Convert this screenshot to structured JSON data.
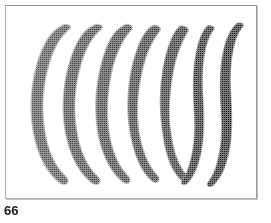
{
  "figure": {
    "caption_number": "66",
    "background_color": "#ffffff",
    "frame_color": "#8c8c8c",
    "caption_color": "#1b1b1b",
    "page_width": 271,
    "page_height": 223,
    "plate": {
      "x": 5,
      "y": 5,
      "width": 252,
      "height": 194
    },
    "specimen_count": 7,
    "specimens": [
      {
        "index": 1,
        "label": "specimen-1",
        "shape": "broad-crescent",
        "fill": "#4a4a4a",
        "edge": "#8e8e8e",
        "max_width_px": 26,
        "height_px": 150,
        "center_x": 52,
        "curvature": "strong-left-bow",
        "path": "M 62 27 C 52 31 44 44 38 64 C 31 88 30 116 36 140 C 41 160 50 174 60 182 C 63 184 66 184 67 182 C 68 180 66 178 63 175 C 54 166 47 151 44 132 C 40 110 42 85 48 64 C 53 47 60 36 67 30 C 70 28 70 26 68 26 C 66 25 64 25 62 27 Z"
      },
      {
        "index": 2,
        "label": "specimen-2",
        "shape": "crescent",
        "fill": "#3f3f3f",
        "edge": "#8a8a8a",
        "max_width_px": 23,
        "height_px": 150,
        "center_x": 82,
        "curvature": "strong-left-bow",
        "path": "M 93 27 C 83 31 76 44 70 64 C 63 88 62 116 68 140 C 73 160 82 174 92 182 C 95 184 98 184 99 182 C 100 180 98 178 95 175 C 86 166 79 151 76 132 C 72 110 74 85 80 64 C 85 47 92 36 99 30 C 102 28 102 26 100 26 C 98 25 95 25 93 27 Z"
      },
      {
        "index": 3,
        "label": "specimen-3",
        "shape": "crescent",
        "fill": "#3a3a3a",
        "edge": "#868686",
        "max_width_px": 21,
        "height_px": 150,
        "center_x": 112,
        "curvature": "medium-left-bow",
        "path": "M 123 27 C 114 31 107 45 102 65 C 96 88 95 115 100 139 C 105 159 113 173 123 181 C 126 183 128 183 129 181 C 130 179 128 177 125 174 C 117 165 111 151 108 132 C 105 111 107 86 112 66 C 117 49 123 38 129 31 C 132 29 132 27 130 26 C 128 25 125 25 123 27 Z"
      },
      {
        "index": 4,
        "label": "specimen-4",
        "shape": "narrow-crescent",
        "fill": "#353535",
        "edge": "#838383",
        "max_width_px": 18,
        "height_px": 150,
        "center_x": 141,
        "curvature": "medium-left-bow",
        "path": "M 152 27 C 144 32 138 46 133 66 C 128 89 127 115 132 138 C 136 158 143 172 152 180 C 155 182 157 182 158 180 C 159 178 157 176 154 173 C 147 164 141 150 138 132 C 135 112 137 88 142 68 C 146 51 152 40 158 32 C 160 30 160 28 158 27 C 156 26 154 26 152 27 Z"
      },
      {
        "index": 5,
        "label": "specimen-5",
        "shape": "slender-curve",
        "fill": "#2e2e2e",
        "edge": "#7f7f7f",
        "max_width_px": 14,
        "height_px": 150,
        "center_x": 170,
        "curvature": "slight-left-bow",
        "path": "M 180 27 C 173 33 168 47 164 67 C 160 89 160 114 164 137 C 167 157 173 171 181 179 C 184 181 186 181 187 179 C 188 177 186 175 183 172 C 177 163 172 150 170 132 C 167 113 169 89 173 69 C 176 53 181 42 186 33 C 188 31 188 29 186 28 C 184 27 182 26 180 27 Z"
      },
      {
        "index": 6,
        "label": "specimen-6",
        "shape": "sigmoid",
        "fill": "#232323",
        "edge": "#787878",
        "max_width_px": 11,
        "height_px": 150,
        "center_x": 198,
        "curvature": "s-curve",
        "path": "M 207 27 C 201 34 197 47 195 65 C 193 82 194 98 195 114 C 196 131 195 147 191 161 C 189 170 186 176 183 180 C 181 182 182 184 184 184 C 186 184 188 182 190 179 C 196 171 200 158 202 142 C 204 126 203 109 202 93 C 201 77 202 61 205 48 C 207 40 209 35 212 31 C 214 29 214 27 212 27 C 210 26 208 26 207 27 Z"
      },
      {
        "index": 7,
        "label": "specimen-7",
        "shape": "sigmoid",
        "fill": "#1a1a1a",
        "edge": "#727272",
        "max_width_px": 11,
        "height_px": 152,
        "center_x": 226,
        "curvature": "s-curve",
        "path": "M 236 25 C 229 32 224 46 222 64 C 220 82 221 99 222 115 C 223 132 222 148 218 162 C 216 171 212 178 209 182 C 207 184 208 186 210 186 C 212 186 215 183 217 180 C 224 171 228 157 230 141 C 232 125 231 108 230 92 C 229 76 230 60 233 47 C 235 38 238 32 241 28 C 243 26 243 24 241 24 C 239 23 237 24 236 25 Z"
      }
    ]
  }
}
